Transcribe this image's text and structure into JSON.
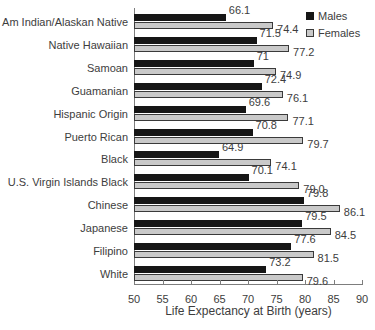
{
  "chart_data": {
    "type": "bar",
    "orientation": "horizontal",
    "xlabel": "Life Expectancy at Birth (years)",
    "xlim": [
      50,
      90
    ],
    "xticks": [
      50,
      55,
      60,
      65,
      70,
      75,
      80,
      85,
      90
    ],
    "grid": false,
    "legend_position": "top-right",
    "categories": [
      "Am Indian/Alaskan Native",
      "Native Hawaiian",
      "Samoan",
      "Guamanian",
      "Hispanic Origin",
      "Puerto Rican",
      "Black",
      "U.S. Virgin Islands Black",
      "Chinese",
      "Japanese",
      "Filipino",
      "White"
    ],
    "series": [
      {
        "name": "Males",
        "color": "#161616",
        "values": [
          66.1,
          71.5,
          71,
          72.4,
          69.6,
          70.8,
          64.9,
          70.1,
          79.8,
          79.5,
          77.6,
          73.2
        ],
        "labels": [
          "66.1",
          "71.5",
          "71",
          "72.4",
          "69.6",
          "70.8",
          "64.9",
          "70.1",
          "79.8",
          "79.5",
          "77.6",
          "73.2"
        ]
      },
      {
        "name": "Females",
        "color": "#c9c9c9",
        "values": [
          74.4,
          77.2,
          74.9,
          76.1,
          77.1,
          79.7,
          74.1,
          79.0,
          86.1,
          84.5,
          81.5,
          79.6
        ],
        "labels": [
          "74.4",
          "77.2",
          "74.9",
          "76.1",
          "77.1",
          "79.7",
          "74.1",
          "79.0",
          "86.1",
          "84.5",
          "81.5",
          "79.6"
        ]
      }
    ],
    "colors": {
      "bar_border": "#3a3a3a",
      "axis": "#7d7d7d",
      "text": "#3d3d3d"
    }
  }
}
